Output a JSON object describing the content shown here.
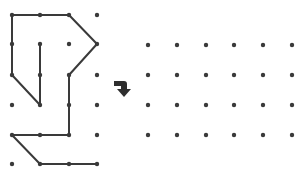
{
  "puzzle": {
    "description": "Rotate the shape drawn on the dot grid onto the empty grid",
    "colors": {
      "ink": "#3a3a3a",
      "background": "#ffffff"
    },
    "left_grid": {
      "cols_x": [
        12,
        40,
        69,
        97
      ],
      "rows_y": [
        15,
        44,
        75,
        105,
        135,
        164
      ],
      "segments": [
        [
          [
            0,
            0
          ],
          [
            1,
            0
          ]
        ],
        [
          [
            1,
            0
          ],
          [
            2,
            0
          ]
        ],
        [
          [
            2,
            0
          ],
          [
            3,
            1
          ]
        ],
        [
          [
            3,
            1
          ],
          [
            2,
            2
          ]
        ],
        [
          [
            2,
            2
          ],
          [
            2,
            3
          ]
        ],
        [
          [
            2,
            3
          ],
          [
            2,
            4
          ]
        ],
        [
          [
            2,
            4
          ],
          [
            1,
            4
          ]
        ],
        [
          [
            1,
            4
          ],
          [
            0,
            4
          ]
        ],
        [
          [
            0,
            4
          ],
          [
            1,
            5
          ]
        ],
        [
          [
            1,
            5
          ],
          [
            2,
            5
          ]
        ],
        [
          [
            2,
            5
          ],
          [
            3,
            5
          ]
        ],
        [
          [
            0,
            0
          ],
          [
            0,
            1
          ]
        ],
        [
          [
            0,
            1
          ],
          [
            0,
            2
          ]
        ],
        [
          [
            0,
            2
          ],
          [
            1,
            3
          ]
        ],
        [
          [
            1,
            3
          ],
          [
            1,
            2
          ]
        ],
        [
          [
            1,
            2
          ],
          [
            1,
            1
          ]
        ]
      ]
    },
    "arrow": {
      "icon": "turn-right-down-arrow-icon"
    },
    "right_grid": {
      "cols_x": [
        148,
        177,
        206,
        234,
        263,
        292
      ],
      "rows_y": [
        45,
        75,
        105,
        135
      ]
    }
  }
}
